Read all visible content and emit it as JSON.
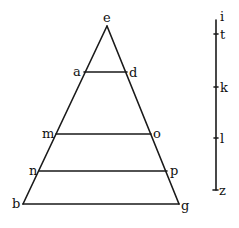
{
  "diagram": {
    "type": "geometric-figure",
    "triangle": {
      "apex": {
        "label": "e",
        "x": 107,
        "y": 26
      },
      "base": {
        "left": {
          "label": "b",
          "x": 23,
          "y": 204
        },
        "right": {
          "label": "g",
          "x": 179,
          "y": 204
        }
      },
      "cross_lines": [
        {
          "left": "a",
          "right": "d",
          "y": 72,
          "x1": 84,
          "x2": 127
        },
        {
          "left": "m",
          "right": "o",
          "y": 134,
          "x1": 56,
          "x2": 151
        },
        {
          "left": "n",
          "right": "p",
          "y": 171,
          "x1": 39,
          "x2": 167
        }
      ]
    },
    "scale_line": {
      "x": 216,
      "top_label": "i",
      "bottom_label": "z",
      "marks": [
        {
          "label": "i",
          "y": 20
        },
        {
          "label": "t",
          "y": 34
        },
        {
          "label": "k",
          "y": 87
        },
        {
          "label": "l",
          "y": 138
        },
        {
          "label": "z",
          "y": 190
        }
      ]
    },
    "labels": {
      "e": "e",
      "a": "a",
      "d": "d",
      "m": "m",
      "o": "o",
      "n": "n",
      "p": "p",
      "b": "b",
      "g": "g",
      "i": "i",
      "t": "t",
      "k": "k",
      "l": "l",
      "z": "z"
    }
  }
}
